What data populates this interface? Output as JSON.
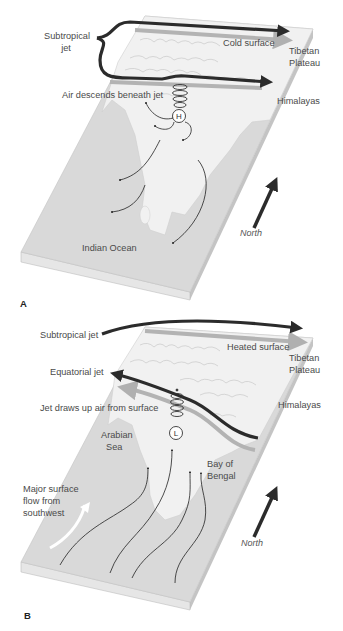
{
  "figure": {
    "panels": [
      {
        "id": "A",
        "letter": "A",
        "labels": {
          "subtropical_jet": [
            "Subtropical",
            "jet"
          ],
          "surface": "Cold surface",
          "tibetan_plateau": [
            "Tibetan",
            "Plateau"
          ],
          "himalayas": "Himalayas",
          "air_motion": "Air descends beneath jet",
          "pressure": "H",
          "ocean": "Indian Ocean",
          "north": "North"
        }
      },
      {
        "id": "B",
        "letter": "B",
        "labels": {
          "subtropical_jet": "Subtropical jet",
          "surface": "Heated surface",
          "tibetan_plateau": [
            "Tibetan",
            "Plateau"
          ],
          "equatorial_jet": "Equatorial jet",
          "himalayas": "Himalayas",
          "air_motion": "Jet draws up air from surface",
          "pressure": "L",
          "arabian_sea": [
            "Arabian",
            "Sea"
          ],
          "bay_of_bengal": [
            "Bay of",
            "Bengal"
          ],
          "surface_flow": [
            "Major surface",
            "flow from",
            "southwest"
          ],
          "north": "North"
        }
      }
    ],
    "colors": {
      "jet": "#2b2b2b",
      "surface_band": "#a9a9a9",
      "land": "#efefef",
      "ocean": "#dadada",
      "block_side": "#c9c9c9",
      "text": "#4a4a4a"
    }
  }
}
